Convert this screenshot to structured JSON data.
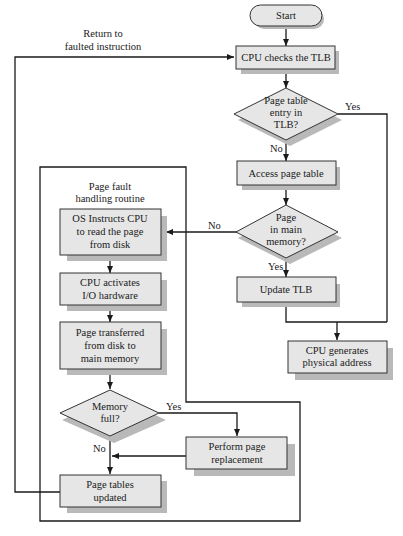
{
  "diagram": {
    "start": "Start",
    "return_label": [
      "Return to",
      "faulted instruction"
    ],
    "cpu_checks_tlb": "CPU checks the TLB",
    "decision_tlb": [
      "Page table",
      "entry in",
      "TLB?"
    ],
    "decision_tlb_yes": "Yes",
    "decision_tlb_no": "No",
    "access_page_table": "Access page table",
    "decision_memory": [
      "Page",
      "in main",
      "memory?"
    ],
    "decision_memory_no": "No",
    "decision_memory_yes": "Yes",
    "update_tlb": "Update TLB",
    "cpu_generates": [
      "CPU generates",
      "physical address"
    ],
    "routine_label": [
      "Page fault",
      "handling routine"
    ],
    "os_instructs": [
      "OS Instructs CPU",
      "to read the page",
      "from disk"
    ],
    "cpu_activates": [
      "CPU activates",
      "I/O hardware"
    ],
    "page_transferred": [
      "Page transferred",
      "from disk to",
      "main memory"
    ],
    "decision_full": [
      "Memory",
      "full?"
    ],
    "decision_full_yes": "Yes",
    "decision_full_no": "No",
    "perform_replacement": [
      "Perform page",
      "replacement"
    ],
    "page_tables_updated": [
      "Page tables",
      "updated"
    ]
  },
  "colors": {
    "box_fill": "#e6e6e6",
    "shadow": "#b9b9b9",
    "line": "#1a1a1a"
  }
}
